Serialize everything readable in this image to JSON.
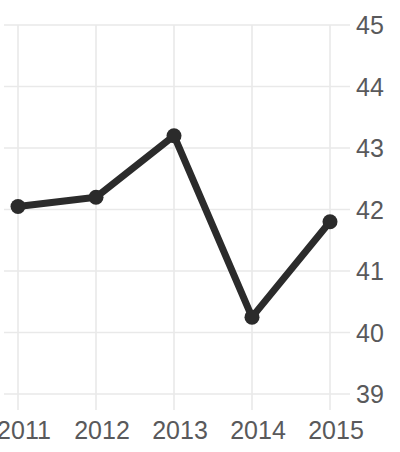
{
  "chart_data": {
    "type": "line",
    "title": "Freedom Trend",
    "xlabel": "",
    "ylabel": "",
    "categories": [
      "2011",
      "2012",
      "2013",
      "2014",
      "2015"
    ],
    "x": [
      2011,
      2012,
      2013,
      2014,
      2015
    ],
    "values": [
      42.05,
      42.2,
      43.2,
      40.25,
      41.8
    ],
    "series": [
      {
        "name": "Freedom Trend",
        "values": [
          42.05,
          42.2,
          43.2,
          40.25,
          41.8
        ]
      }
    ],
    "ylim": [
      39,
      45
    ],
    "yticks": [
      39,
      40,
      41,
      42,
      43,
      44,
      45
    ],
    "ytick_labels": [
      "39",
      "40",
      "41",
      "42",
      "43",
      "44",
      "45"
    ],
    "xticks": [
      2011,
      2012,
      2013,
      2014,
      2015
    ],
    "xtick_labels": [
      "2011",
      "2012",
      "2013",
      "2014",
      "2015"
    ],
    "grid": true,
    "grid_axis": "both",
    "legend": false,
    "legend_position": "none",
    "y_axis_side": "right",
    "markers": true,
    "marker_shape": "circle",
    "colors": {
      "line": "#2b2b2b",
      "marker": "#2b2b2b",
      "grid": "#e9e9e9",
      "tick_text": "#59595b",
      "title_text": "#231f20",
      "background": "#ffffff"
    },
    "line_width_px": 7,
    "marker_radius_px": 7.5
  }
}
